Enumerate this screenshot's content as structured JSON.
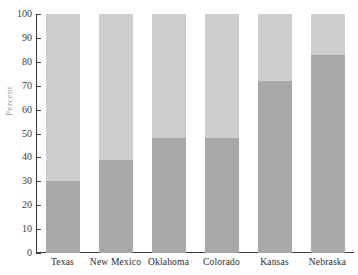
{
  "chart_data": {
    "type": "bar",
    "stacked": true,
    "title": "",
    "xlabel": "",
    "ylabel": "Percent",
    "ylim": [
      0,
      100
    ],
    "yticks": [
      0,
      10,
      20,
      30,
      40,
      50,
      60,
      70,
      80,
      90,
      100
    ],
    "grid": false,
    "legend": "none",
    "categories": [
      "Texas",
      "New Mexico",
      "Oklahoma",
      "Colorado",
      "Kansas",
      "Nebraska"
    ],
    "series": [
      {
        "name": "lower-segment",
        "color": "#a8a8a8",
        "values": [
          30,
          39,
          48,
          48,
          72,
          83
        ]
      },
      {
        "name": "upper-segment",
        "color": "#cecece",
        "values": [
          70,
          61,
          52,
          52,
          28,
          17
        ]
      }
    ]
  },
  "axis": {
    "y_title": "Percent",
    "tick_labels": [
      "0",
      "10",
      "20",
      "30",
      "40",
      "50",
      "60",
      "70",
      "80",
      "90",
      "100"
    ]
  },
  "colors": {
    "segment_lower": "#a8a8a8",
    "segment_upper": "#cecece",
    "axis": "#3a3a3a",
    "background": "#ffffff"
  }
}
